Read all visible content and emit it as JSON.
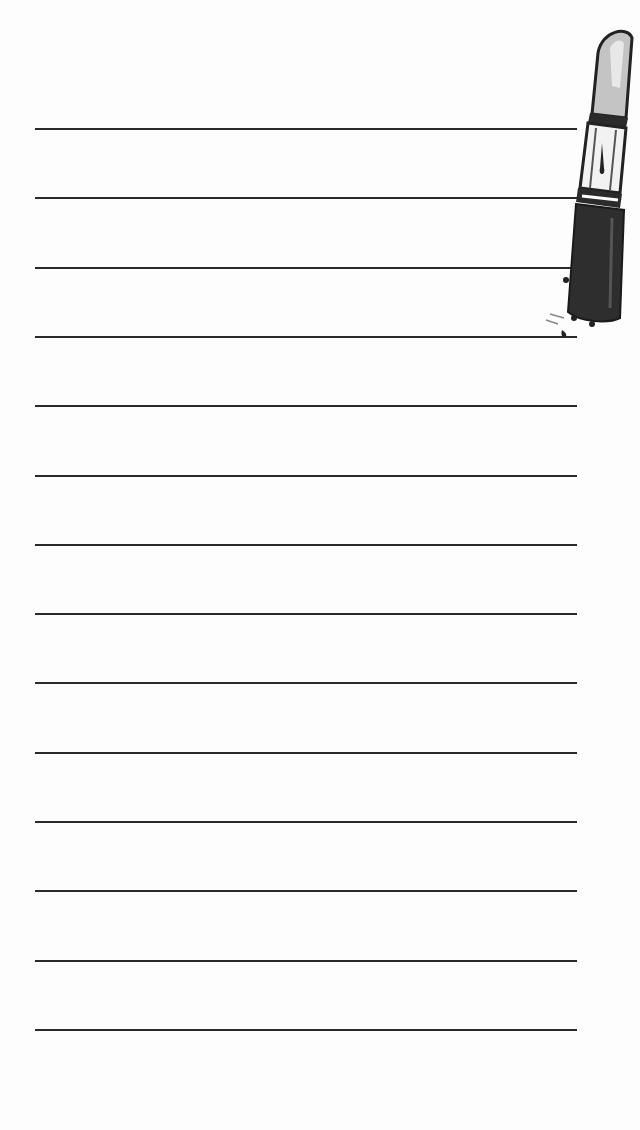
{
  "page": {
    "type": "lined-notepad",
    "background_color": "#fdfdfd",
    "line_color": "#2a2a2a",
    "line_count": 14,
    "line_start_y": 128,
    "line_spacing": 69.3,
    "line_x_start": 35,
    "line_x_end": 577
  },
  "lines": [
    {
      "text": ""
    },
    {
      "text": ""
    },
    {
      "text": ""
    },
    {
      "text": ""
    },
    {
      "text": ""
    },
    {
      "text": ""
    },
    {
      "text": ""
    },
    {
      "text": ""
    },
    {
      "text": ""
    },
    {
      "text": ""
    },
    {
      "text": ""
    },
    {
      "text": ""
    },
    {
      "text": ""
    },
    {
      "text": ""
    }
  ],
  "decoration": {
    "icon": "lipstick-icon",
    "position": "top-right",
    "colors": {
      "tube": "#2b2b2b",
      "bullet": "#bdbdbd",
      "highlight": "#ffffff"
    }
  }
}
